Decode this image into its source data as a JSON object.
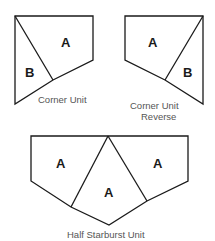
{
  "colors": {
    "stroke": "#1a1a1a",
    "fill": "#ffffff",
    "caption": "#555555"
  },
  "units": [
    {
      "name": "corner-unit",
      "caption_lines": [
        "Corner Unit"
      ],
      "pieces": [
        {
          "label": "A"
        },
        {
          "label": "B"
        }
      ]
    },
    {
      "name": "corner-unit-reverse",
      "caption_lines": [
        "Corner Unit",
        "Reverse"
      ],
      "pieces": [
        {
          "label": "A"
        },
        {
          "label": "B"
        }
      ]
    },
    {
      "name": "half-starburst-unit",
      "caption_lines": [
        "Half Starburst Unit"
      ],
      "pieces": [
        {
          "label": "A"
        },
        {
          "label": "A"
        },
        {
          "label": "A"
        }
      ]
    }
  ]
}
